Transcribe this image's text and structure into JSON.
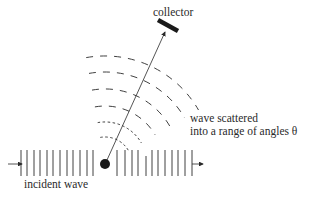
{
  "labels": {
    "collector": "collector",
    "scattered_line1": "wave scattered",
    "scattered_line2": "into a range of angles θ",
    "incident": "incident wave"
  },
  "colors": {
    "ink": "#2a2a2a",
    "background": "#ffffff"
  },
  "geometry": {
    "scatterer": {
      "cx": 105,
      "cy": 164,
      "r": 5
    },
    "incident_lines_x": [
      21,
      27,
      34,
      40,
      47,
      53,
      60,
      67,
      73,
      80,
      87,
      93
    ],
    "transmitted_lines_x": [
      117,
      125,
      132,
      138,
      146,
      152,
      158,
      165,
      172,
      178,
      185,
      192
    ],
    "arc_radii": [
      27,
      42,
      58,
      75,
      92,
      108
    ],
    "collector": {
      "x1": 158,
      "y1": 20,
      "x2": 178,
      "y2": 31
    }
  }
}
